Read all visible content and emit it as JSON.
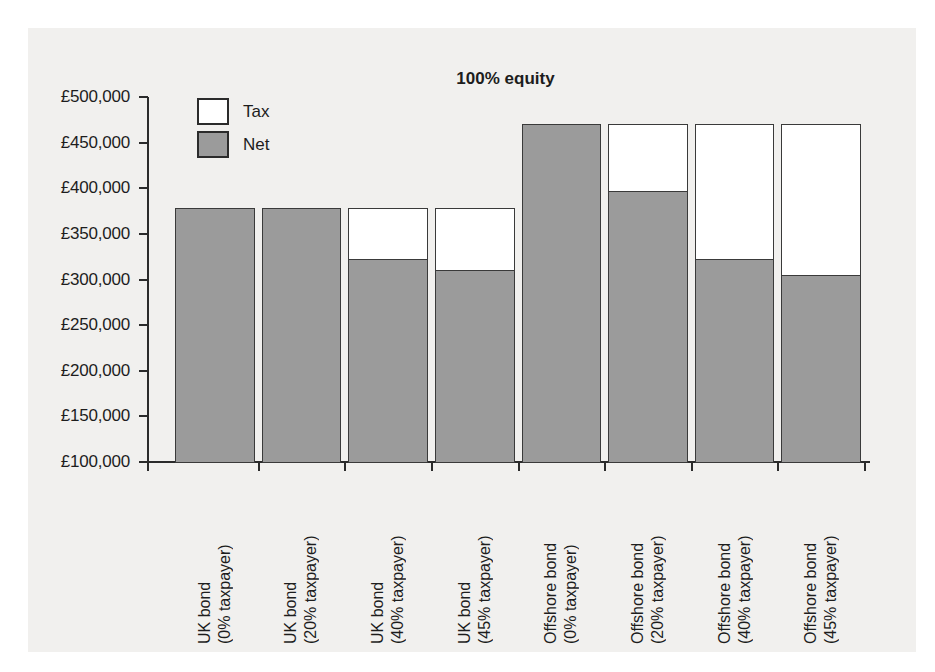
{
  "chart_data": {
    "type": "bar",
    "subtype": "stacked-bar",
    "title": "100% equity",
    "xlabel": "",
    "ylabel": "",
    "ylim": [
      100000,
      500000
    ],
    "ytick_values": [
      500000,
      450000,
      400000,
      350000,
      300000,
      250000,
      200000,
      150000,
      100000
    ],
    "ytick_labels": [
      "£500,000",
      "£450,000",
      "£400,000",
      "£350,000",
      "£300,000",
      "£250,000",
      "£200,000",
      "£150,000",
      "£100,000"
    ],
    "grid": false,
    "legend_position": "top-left inside axes",
    "legend": [
      {
        "name": "Tax",
        "color": "#ffffff"
      },
      {
        "name": "Net",
        "color": "#9b9b9b"
      }
    ],
    "categories": [
      "UK bond (0% taxpayer)",
      "UK bond (20% taxpayer)",
      "UK bond (40% taxpayer)",
      "UK bond (45% taxpayer)",
      "Offshore bond (0% taxpayer)",
      "Offshore bond (20% taxpayer)",
      "Offshore bond (40% taxpayer)",
      "Offshore bond (45% taxpayer)"
    ],
    "category_lines": [
      [
        "UK bond",
        "(0% taxpayer)"
      ],
      [
        "UK bond",
        "(20% taxpayer)"
      ],
      [
        "UK bond",
        "(40% taxpayer)"
      ],
      [
        "UK bond",
        "(45% taxpayer)"
      ],
      [
        "Offshore bond",
        "(0% taxpayer)"
      ],
      [
        "Offshore bond",
        "(20% taxpayer)"
      ],
      [
        "Offshore bond",
        "(40% taxpayer)"
      ],
      [
        "Offshore bond",
        "(45% taxpayer)"
      ]
    ],
    "series": [
      {
        "name": "Net",
        "color": "#9b9b9b",
        "values": [
          378000,
          378000,
          322000,
          310000,
          470000,
          397000,
          322000,
          305000
        ]
      },
      {
        "name": "Tax",
        "color": "#ffffff",
        "values": [
          0,
          0,
          56000,
          68000,
          0,
          73000,
          148000,
          165000
        ]
      }
    ],
    "totals": [
      378000,
      378000,
      378000,
      378000,
      470000,
      470000,
      470000,
      470000
    ]
  },
  "style": {
    "panel_background": "#f1f0ee",
    "page_background": "#ffffff",
    "axis_color": "#2b2b2b",
    "net_color": "#9b9b9b",
    "tax_color": "#ffffff",
    "text_color": "#1d1d1d"
  }
}
